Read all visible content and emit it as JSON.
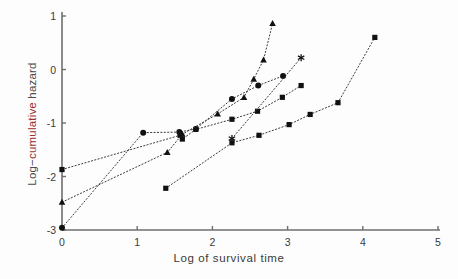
{
  "chart_data": {
    "type": "scatter",
    "title": "",
    "subtitle": "",
    "xlabel": "Log of survival time",
    "ylabel": "Log−cumulative hazard",
    "xlim": [
      0,
      5
    ],
    "ylim": [
      -3,
      1
    ],
    "xticks": [
      0,
      1,
      2,
      3,
      4,
      5
    ],
    "xticklabels": [
      "0",
      "1",
      "2",
      "3",
      "4",
      "5"
    ],
    "yticks": [
      1,
      0,
      -1,
      -2,
      -3
    ],
    "yticklabels": [
      "1",
      "0",
      "-1",
      "-2",
      "-3"
    ],
    "grid": false,
    "legend": "none",
    "linestyle": "dotted",
    "marker_color": "#111111",
    "axis_color": "#6e6e6e",
    "series": [
      {
        "name": "group-1",
        "marker": "square",
        "x": [
          0.0,
          1.57,
          1.6,
          1.78,
          2.26,
          2.6,
          2.93,
          3.18
        ],
        "y": [
          -1.87,
          -1.23,
          -1.3,
          -1.12,
          -0.93,
          -0.78,
          -0.52,
          -0.3
        ]
      },
      {
        "name": "group-2",
        "marker": "circle",
        "x": [
          0.0,
          1.08,
          1.56,
          1.78,
          2.26,
          2.61,
          2.94
        ],
        "y": [
          -2.96,
          -1.18,
          -1.17,
          -1.11,
          -0.55,
          -0.3,
          -0.12
        ]
      },
      {
        "name": "group-3",
        "marker": "triangle",
        "x": [
          0.0,
          1.4,
          1.6,
          2.07,
          2.42,
          2.55,
          2.68,
          2.8
        ],
        "y": [
          -2.48,
          -1.55,
          -1.21,
          -0.83,
          -0.52,
          -0.18,
          0.18,
          0.86
        ]
      },
      {
        "name": "group-4",
        "marker": "square",
        "x": [
          1.38,
          2.26,
          2.62,
          3.02,
          3.3,
          3.67,
          4.16
        ],
        "y": [
          -2.22,
          -1.37,
          -1.23,
          -1.03,
          -0.84,
          -0.62,
          0.6
        ]
      },
      {
        "name": "group-5",
        "marker": "asterisk",
        "x": [
          2.26,
          3.18
        ],
        "y": [
          -1.29,
          0.22
        ]
      }
    ]
  }
}
